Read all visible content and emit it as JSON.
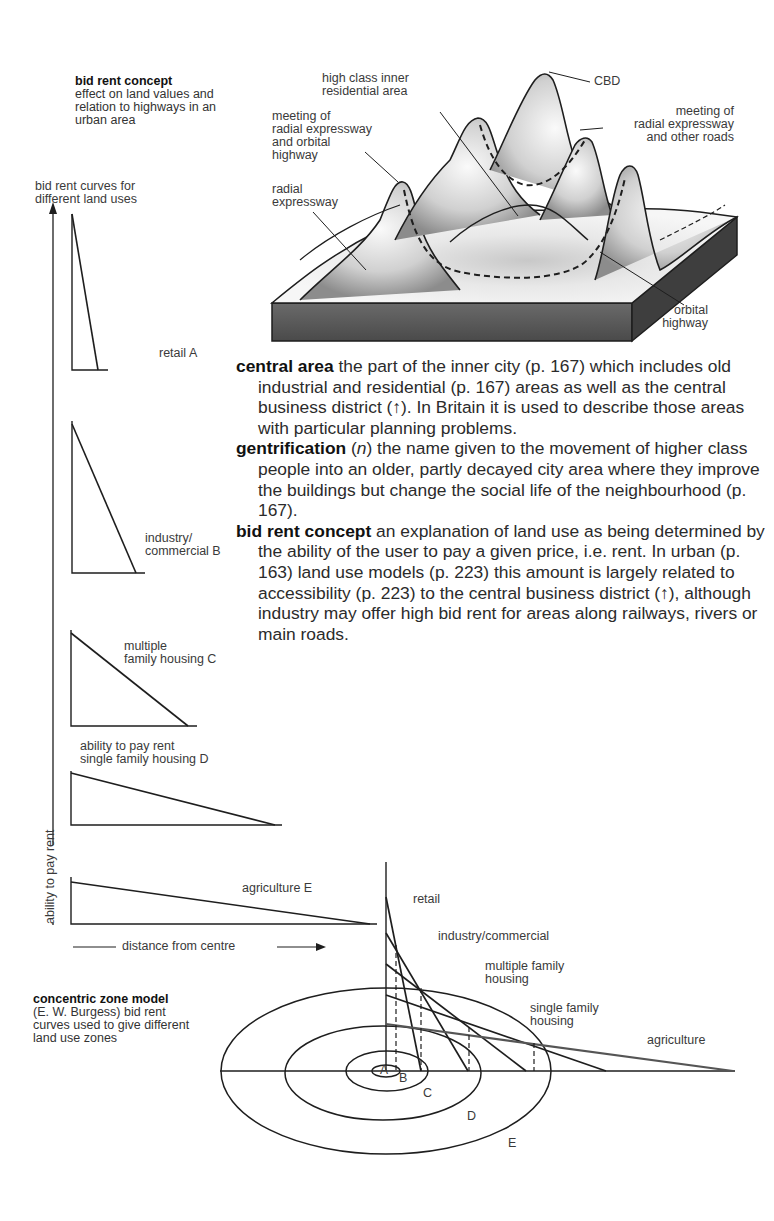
{
  "figure_top": {
    "title": "bid rent concept",
    "subtitle_lines": [
      "effect on land values and",
      "relation to highways in an",
      "urban area"
    ],
    "block_diagram_labels": {
      "high_class": [
        "high class inner",
        "residential area"
      ],
      "cbd": "CBD",
      "meeting_radial_orbital": [
        "meeting of",
        "radial expressway",
        "and orbital",
        "highway"
      ],
      "radial_expressway": [
        "radial",
        "expressway"
      ],
      "meeting_radial_other": [
        "meeting of",
        "radial expressway",
        "and other roads"
      ],
      "orbital_highway": [
        "orbital",
        "highway"
      ]
    }
  },
  "bid_rent_curves": {
    "heading": [
      "bid rent curves for",
      "different land uses"
    ],
    "y_axis_label": "ability to pay rent",
    "x_axis_label": "distance from centre",
    "inline_axis_note": "ability to pay rent",
    "curves": [
      {
        "id": "A",
        "label": [
          "retail A"
        ]
      },
      {
        "id": "B",
        "label": [
          "industry/",
          "commercial B"
        ]
      },
      {
        "id": "C",
        "label": [
          "multiple",
          "family housing C"
        ]
      },
      {
        "id": "D",
        "label": [
          "single family housing D"
        ]
      },
      {
        "id": "E",
        "label": [
          "agriculture E"
        ]
      }
    ]
  },
  "glossary": [
    {
      "term": "central area",
      "pos": "",
      "text": " the part of the inner city (p. 167) which includes old industrial and residential (p. 167) areas as well as the central business district (↑). In Britain it is used to describe those areas with particular planning problems."
    },
    {
      "term": "gentrification",
      "pos": "n",
      "text": " the name given to the movement of higher class people into an older, partly decayed city area where they improve the buildings but change the social life of the neighbourhood (p. 167)."
    },
    {
      "term": "bid rent concept",
      "pos": "",
      "text": " an explanation of land use as being determined by the ability of the user to pay a given price, i.e. rent. In urban (p. 163) land use models (p. 223) this amount is largely related to accessibility (p. 223) to the central business district (↑), although industry may offer high bid rent for areas along railways, rivers or main roads."
    }
  ],
  "concentric_model": {
    "title": "concentric zone model",
    "subtitle_lines": [
      "(E. W. Burgess) bid rent",
      "curves used to give different",
      "land use zones"
    ],
    "curve_labels": {
      "retail": "retail",
      "industry": "industry/commercial",
      "multiple": [
        "multiple family",
        "housing"
      ],
      "single": [
        "single family",
        "housing"
      ],
      "agriculture": "agriculture"
    },
    "zones": [
      "A",
      "B",
      "C",
      "D",
      "E"
    ]
  },
  "colors": {
    "ink": "#1e1e1e",
    "text": "#2b2b2b",
    "block_side": "#5a5a5a",
    "surface_light": "#f0f0f0",
    "surface_shadow": "#8a8a8a"
  }
}
